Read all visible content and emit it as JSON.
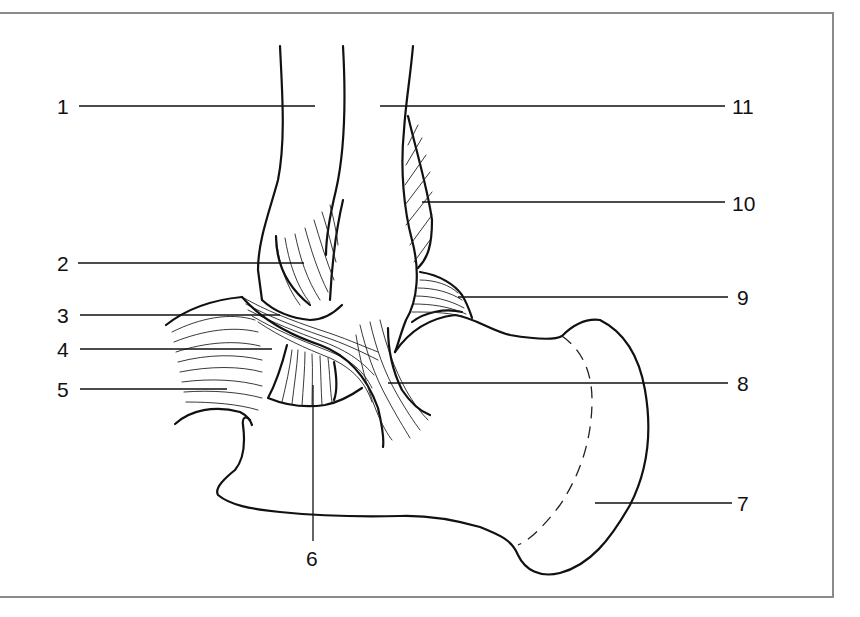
{
  "figure": {
    "type": "anatomical line drawing",
    "frame_color": "#8a8a8a",
    "line_color": "#111111",
    "background": "#ffffff"
  },
  "labels": {
    "left": [
      {
        "id": "1",
        "text": "1"
      },
      {
        "id": "2",
        "text": "2"
      },
      {
        "id": "3",
        "text": "3"
      },
      {
        "id": "4",
        "text": "4"
      },
      {
        "id": "5",
        "text": "5"
      }
    ],
    "bottom": [
      {
        "id": "6",
        "text": "6"
      }
    ],
    "right": [
      {
        "id": "7",
        "text": "7"
      },
      {
        "id": "8",
        "text": "8"
      },
      {
        "id": "9",
        "text": "9"
      },
      {
        "id": "10",
        "text": "10"
      },
      {
        "id": "11",
        "text": "11"
      }
    ]
  }
}
